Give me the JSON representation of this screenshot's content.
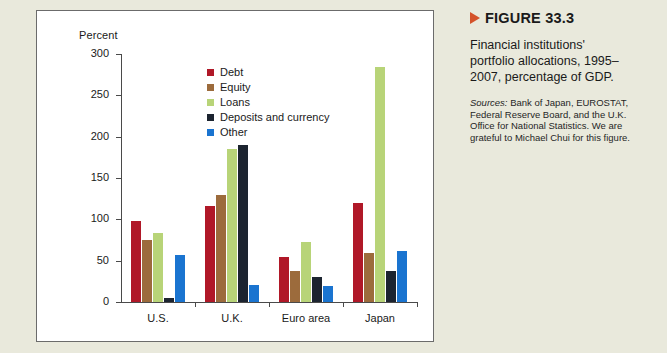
{
  "chart_data": {
    "type": "bar",
    "title": "",
    "xlabel": "",
    "ylabel": "Percent",
    "ylim": [
      0,
      300
    ],
    "yticks": [
      0,
      50,
      100,
      150,
      200,
      250,
      300
    ],
    "grid": false,
    "legend_position": "upper-center-inside",
    "categories": [
      "U.S.",
      "U.K.",
      "Euro area",
      "Japan"
    ],
    "series": [
      {
        "name": "Debt",
        "color": "#b01828",
        "values": [
          98,
          116,
          55,
          120
        ]
      },
      {
        "name": "Equity",
        "color": "#9c6b3c",
        "values": [
          75,
          129,
          37,
          59
        ]
      },
      {
        "name": "Loans",
        "color": "#b8d478",
        "values": [
          83,
          185,
          72,
          284
        ]
      },
      {
        "name": "Deposits and currency",
        "color": "#1c2430",
        "values": [
          5,
          190,
          30,
          38
        ]
      },
      {
        "name": "Other",
        "color": "#1a74d0",
        "values": [
          57,
          21,
          19,
          62
        ]
      }
    ]
  },
  "caption": {
    "figure_number": "FIGURE 33.3",
    "description": "Financial institutions' portfolio allocations, 1995–2007, percentage of GDP.",
    "sources_label": "Sources:",
    "sources_text": " Bank of Japan, EUROSTAT, Federal Reserve Board, and the U.K. Office for National Statistics. We are grateful to Michael Chui for this figure."
  },
  "colors": {
    "page_background": "#e9e9dc",
    "panel_background": "#ffffff",
    "panel_border": "#6b6b6b",
    "axis": "#4a4a4a",
    "marker": "#d4522a",
    "text": "#1a1a1a"
  }
}
